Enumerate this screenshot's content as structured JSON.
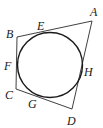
{
  "figure": {
    "quadrilateral": {
      "vertices": [
        {
          "name": "A",
          "x": 92,
          "y": 21
        },
        {
          "name": "B",
          "x": 17,
          "y": 37
        },
        {
          "name": "C",
          "x": 16,
          "y": 89
        },
        {
          "name": "D",
          "x": 72,
          "y": 109
        }
      ]
    },
    "circle": {
      "cx": 50,
      "cy": 65,
      "r": 33
    },
    "labels": {
      "A": "A",
      "B": "B",
      "C": "C",
      "D": "D",
      "E": "E",
      "F": "F",
      "G": "G",
      "H": "H"
    },
    "tangent_points": [
      {
        "name": "E",
        "side": "AB"
      },
      {
        "name": "F",
        "side": "BC"
      },
      {
        "name": "G",
        "side": "CD"
      },
      {
        "name": "H",
        "side": "DA"
      }
    ]
  }
}
